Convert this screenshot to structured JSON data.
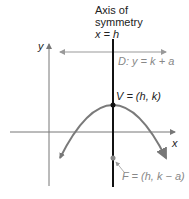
{
  "title_line1": "Axis of",
  "title_line2": "symmetry",
  "title_line3": "x = h",
  "y_axis_label": "y",
  "x_axis_label": "x",
  "directrix_label": "D: y = k + a",
  "vertex_label": "V = (h, k)",
  "focus_label": "F = (h, k − a)",
  "colors": {
    "axis": "#777777",
    "parabola": "#7a7a7a",
    "symmetry_axis": "#111111",
    "directrix": "#999999",
    "focus": "#888888",
    "vertex": "#111111"
  }
}
